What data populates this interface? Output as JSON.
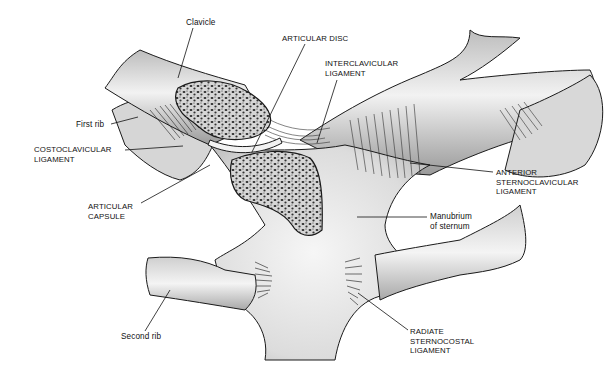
{
  "figure": {
    "labels": [
      {
        "id": "clavicle",
        "text": "Clavicle",
        "x": 186,
        "y": 18
      },
      {
        "id": "articular-disc",
        "text": "ARTICULAR DISC",
        "x": 282,
        "y": 34
      },
      {
        "id": "interclavicular-ligament",
        "text": "INTERCLAVICULAR\nLIGAMENT",
        "x": 325,
        "y": 59
      },
      {
        "id": "first-rib",
        "text": "First rib",
        "x": 76,
        "y": 120
      },
      {
        "id": "costoclavicular-ligament",
        "text": "COSTOCLAVICULAR\nLIGAMENT",
        "x": 34,
        "y": 145
      },
      {
        "id": "anterior-sternoclavicular-ligament",
        "text": "ANTERIOR\nSTERNOCLAVICULAR\nLIGAMENT",
        "x": 496,
        "y": 168
      },
      {
        "id": "articular-capsule",
        "text": "ARTICULAR\nCAPSULE",
        "x": 88,
        "y": 202
      },
      {
        "id": "manubrium-of-sternum",
        "text": "Manubrium\nof sternum",
        "x": 430,
        "y": 212
      },
      {
        "id": "second-rib",
        "text": "Second rib",
        "x": 121,
        "y": 332
      },
      {
        "id": "radiate-sternocostal-ligament",
        "text": "RADIATE\nSTERNOCOSTAL\nLIGAMENT",
        "x": 410,
        "y": 327
      }
    ]
  },
  "colors": {
    "background": "#ffffff",
    "outline": "#1a1a1a",
    "bone_fill": "#e6e6e6",
    "bone_shadow": "#9a9a9a",
    "spongy_bone": "#d0d0d0",
    "trabecular_pores": "#2a2a2a",
    "label_text": "#111111"
  }
}
